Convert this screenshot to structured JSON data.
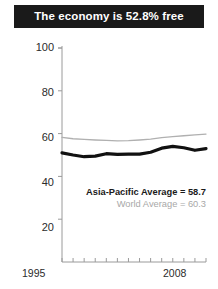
{
  "title": {
    "text": "The economy is 52.8% free"
  },
  "legend": {
    "asia_pacific": "Asia-Pacific Average = 58.7",
    "world": "World Average = 60.3"
  },
  "axis": {
    "x_start_label": "1995",
    "x_end_label": "2008",
    "y_labels": [
      "100",
      "80",
      "60",
      "40",
      "20"
    ]
  },
  "colors": {
    "banner_background": "#1a1a1a",
    "banner_text": "#ffffff",
    "asia_pacific_line": "#111111",
    "world_line": "#b0b0b0",
    "axis": "#9a9a9a",
    "tick_text": "#2b2b2b",
    "world_legend_text": "#a8a8a8"
  },
  "chart_data": {
    "type": "line",
    "title": "The economy is 52.8% free",
    "xlabel": "",
    "ylabel": "",
    "xlim": [
      1995,
      2008
    ],
    "ylim": [
      0,
      100
    ],
    "yticks": [
      20,
      40,
      60,
      80,
      100
    ],
    "xticks": [
      1995,
      1996,
      1997,
      1998,
      1999,
      2000,
      2001,
      2002,
      2003,
      2004,
      2005,
      2006,
      2007,
      2008
    ],
    "xtick_labels_shown": [
      "1995",
      "2008"
    ],
    "grid": false,
    "legend_position": "inside-right",
    "x": [
      1995,
      1996,
      1997,
      1998,
      1999,
      2000,
      2001,
      2002,
      2003,
      2004,
      2005,
      2006,
      2007,
      2008
    ],
    "series": [
      {
        "name": "Asia-Pacific Average",
        "color": "#111111",
        "linewidth": 3.2,
        "final_value": 58.7,
        "values": [
          51.0,
          50.0,
          49.2,
          49.5,
          50.6,
          50.3,
          50.4,
          50.4,
          51.3,
          53.2,
          54.0,
          53.4,
          52.2,
          53.0
        ]
      },
      {
        "name": "World Average",
        "color": "#b0b0b0",
        "linewidth": 1.3,
        "final_value": 60.3,
        "values": [
          58.2,
          57.6,
          57.3,
          57.0,
          56.8,
          56.6,
          56.7,
          57.0,
          57.4,
          58.1,
          58.6,
          59.0,
          59.4,
          59.8
        ]
      }
    ],
    "annotations": [
      {
        "text": "Asia-Pacific Average = 58.7",
        "style": "bold"
      },
      {
        "text": "World Average = 60.3",
        "style": "muted"
      }
    ]
  }
}
